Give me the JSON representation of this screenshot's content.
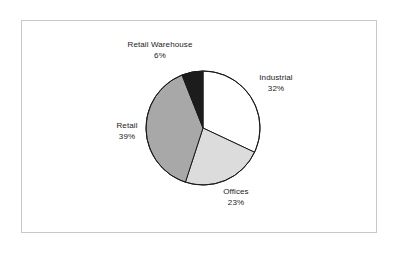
{
  "chart_data": {
    "type": "pie",
    "title": "",
    "subtitle": "",
    "xlabel": "",
    "ylabel": "",
    "legend_position": "none",
    "grid": false,
    "start_angle_deg": 0,
    "direction": "clockwise",
    "categories": [
      "Industrial",
      "Offices",
      "Retail",
      "Retail Warehouse"
    ],
    "values": [
      32,
      23,
      39,
      6
    ],
    "unit": "%",
    "total": 100,
    "slices": [
      {
        "label": "Industrial",
        "value": 32,
        "value_text": "32%",
        "color": "#ffffff",
        "start_deg": 0,
        "end_deg": 115.2
      },
      {
        "label": "Offices",
        "value": 23,
        "value_text": "23%",
        "color": "#dcdcdc",
        "start_deg": 115.2,
        "end_deg": 198.0
      },
      {
        "label": "Retail",
        "value": 39,
        "value_text": "39%",
        "color": "#a8a8a8",
        "start_deg": 198.0,
        "end_deg": 338.4
      },
      {
        "label": "Retail Warehouse",
        "value": 6,
        "value_text": "6%",
        "color": "#1c1c1c",
        "start_deg": 338.4,
        "end_deg": 360.0
      }
    ],
    "geometry": {
      "center_x": 203,
      "center_y": 128,
      "radius": 57,
      "outline_color": "#1a1a1a"
    }
  },
  "frame": {
    "border_color": "#c9c9c9",
    "background": "#ffffff"
  },
  "labels": {
    "retail_warehouse": {
      "name": "Retail Warehouse",
      "value": "6%"
    },
    "industrial": {
      "name": "Industrial",
      "value": "32%"
    },
    "retail": {
      "name": "Retail",
      "value": "39%"
    },
    "offices": {
      "name": "Offices",
      "value": "23%"
    }
  }
}
